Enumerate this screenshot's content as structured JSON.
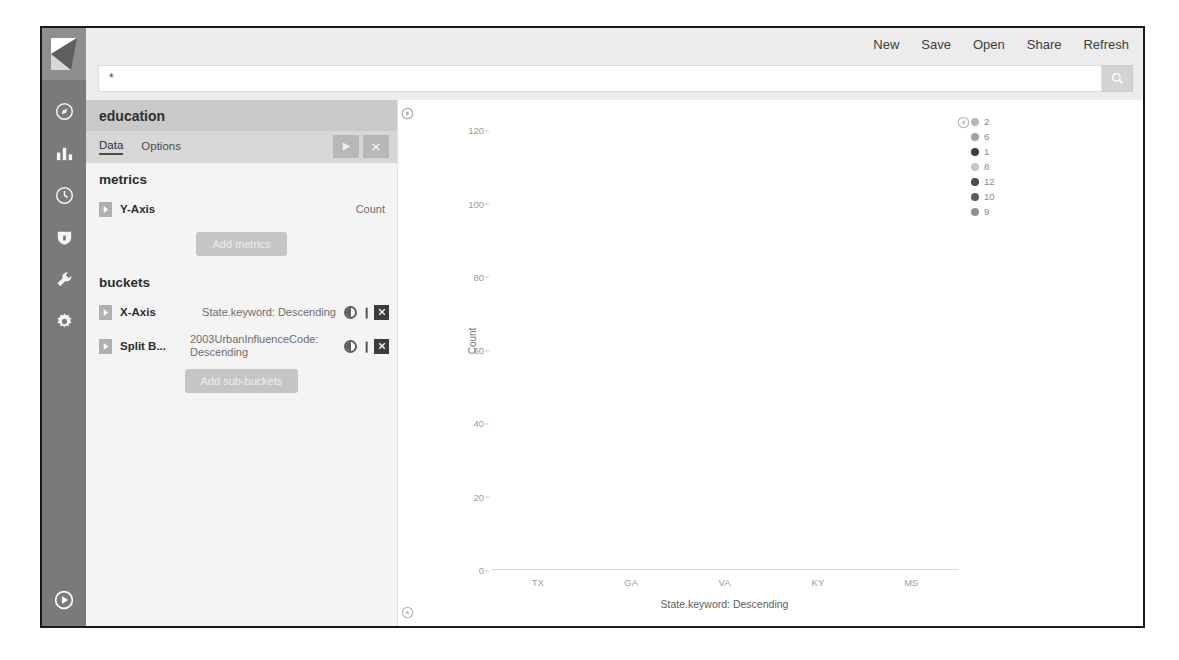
{
  "topbar": {
    "items": [
      {
        "label": "New",
        "name": "new"
      },
      {
        "label": "Save",
        "name": "save"
      },
      {
        "label": "Open",
        "name": "open"
      },
      {
        "label": "Share",
        "name": "share"
      },
      {
        "label": "Refresh",
        "name": "refresh"
      }
    ]
  },
  "search": {
    "value": "*",
    "placeholder": "Search...",
    "button_icon": "search-icon"
  },
  "rail": {
    "logo": "kibana-logo",
    "icons": [
      {
        "name": "discover-icon"
      },
      {
        "name": "visualize-bar-chart-icon"
      },
      {
        "name": "timelion-clock-icon"
      },
      {
        "name": "dev-tools-shield-icon"
      },
      {
        "name": "management-wrench-icon"
      },
      {
        "name": "settings-gear-icon"
      }
    ],
    "collapse_icon": "collapse-arrow-icon"
  },
  "editor": {
    "title": "education",
    "tabs": [
      {
        "label": "Data",
        "active": true
      },
      {
        "label": "Options",
        "active": false
      }
    ],
    "apply_icon": "▶",
    "cancel_icon": "✖",
    "metrics": {
      "heading": "metrics",
      "rows": [
        {
          "label": "Y-Axis",
          "value": "Count"
        }
      ],
      "add_label": "Add metrics"
    },
    "buckets": {
      "heading": "buckets",
      "rows": [
        {
          "label": "X-Axis",
          "value": "State.keyword: Descending"
        },
        {
          "label": "Split B...",
          "value": "2003UrbanInfluenceCode: Descending"
        }
      ],
      "add_label": "Add sub-buckets"
    },
    "close_label": "✖"
  },
  "chart_data": {
    "type": "bar",
    "title": "",
    "stacked": true,
    "xlabel": "State.keyword: Descending",
    "ylabel": "Count",
    "categories": [
      "TX",
      "GA",
      "VA",
      "KY",
      "MS"
    ],
    "yticks": [
      0,
      20,
      40,
      60,
      80,
      100,
      120
    ],
    "ylim": [
      0,
      125
    ],
    "grid": false,
    "legend_position": "right",
    "legend_title": "",
    "series": [
      {
        "name": "2",
        "color": "#b8b8b8",
        "values": [
          45,
          46,
          30,
          22,
          20
        ]
      },
      {
        "name": "6",
        "color": "#a3a3a3",
        "values": [
          32,
          33,
          13,
          0,
          0
        ]
      },
      {
        "name": "1",
        "color": "#3d3d3d",
        "values": [
          40,
          0,
          0,
          0,
          0
        ]
      },
      {
        "name": "8",
        "color": "#c6c6c6",
        "values": [
          0,
          0,
          0,
          16,
          13
        ]
      },
      {
        "name": "12",
        "color": "#4a4a4a",
        "values": [
          0,
          31,
          49,
          14,
          0
        ]
      },
      {
        "name": "10",
        "color": "#5d5d5d",
        "values": [
          0,
          0,
          0,
          0,
          24
        ]
      },
      {
        "name": "9",
        "color": "#8f8f8f",
        "values": [
          0,
          0,
          0,
          0,
          0
        ]
      }
    ],
    "bar_stacks": [
      {
        "category": "TX",
        "segments": [
          {
            "series": "2",
            "value": 45,
            "color": "#b8b8b8"
          },
          {
            "series": "6",
            "value": 32,
            "color": "#a3a3a3"
          },
          {
            "series": "1",
            "value": 40,
            "color": "#3d3d3d"
          }
        ]
      },
      {
        "category": "GA",
        "segments": [
          {
            "series": "2",
            "value": 46,
            "color": "#b8b8b8"
          },
          {
            "series": "6",
            "value": 23,
            "color": "#9e9e9e"
          },
          {
            "series": "12",
            "value": 27,
            "color": "#4a4a4a"
          }
        ]
      },
      {
        "category": "VA",
        "segments": [
          {
            "series": "2",
            "value": 30,
            "color": "#b8b8b8"
          },
          {
            "series": "6",
            "value": 13,
            "color": "#9e9e9e"
          },
          {
            "series": "12",
            "value": 49,
            "color": "#4a4a4a"
          }
        ]
      },
      {
        "category": "KY",
        "segments": [
          {
            "series": "2",
            "value": 22,
            "color": "#b0b0b0"
          },
          {
            "series": "12",
            "value": 14,
            "color": "#4f4f4f"
          },
          {
            "series": "8",
            "value": 16,
            "color": "#b0b0b0"
          }
        ]
      },
      {
        "category": "MS",
        "segments": [
          {
            "series": "2",
            "value": 20,
            "color": "#5d5d5d"
          },
          {
            "series": "10",
            "value": 24,
            "color": "#6b6b6b"
          },
          {
            "series": "8",
            "value": 13,
            "color": "#a8a8a8"
          }
        ]
      }
    ]
  },
  "colors": {
    "rail_bg": "#7a7a7a",
    "editor_bg": "#f4f4f4",
    "accent": "#3d3d3d"
  }
}
